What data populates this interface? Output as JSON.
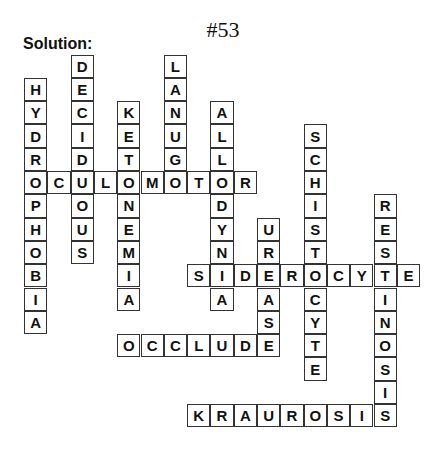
{
  "puzzle": {
    "title": "#53",
    "label": "Solution:"
  },
  "words": [
    {
      "word": "HYDROPHOBIA",
      "direction": "down",
      "row": 1,
      "col": 0
    },
    {
      "word": "DECIDUOUS",
      "direction": "down",
      "row": 0,
      "col": 2
    },
    {
      "word": "KETONEMIA",
      "direction": "down",
      "row": 2,
      "col": 4
    },
    {
      "word": "LANUGO",
      "direction": "down",
      "row": 0,
      "col": 6
    },
    {
      "word": "ALLODYNIA",
      "direction": "down",
      "row": 2,
      "col": 8
    },
    {
      "word": "SCHISTOCYTE",
      "direction": "down",
      "row": 3,
      "col": 12
    },
    {
      "word": "RESTINOSIS",
      "direction": "down",
      "row": 6,
      "col": 15
    },
    {
      "word": "UREASE",
      "direction": "down",
      "row": 7,
      "col": 10
    },
    {
      "word": "OCULOMOTOR",
      "direction": "across",
      "row": 5,
      "col": 0
    },
    {
      "word": "SIDEROCYTE",
      "direction": "across",
      "row": 9,
      "col": 7
    },
    {
      "word": "OCCLUDE",
      "direction": "across",
      "row": 12,
      "col": 4
    },
    {
      "word": "KRAUROSIS",
      "direction": "across",
      "row": 15,
      "col": 7
    }
  ]
}
